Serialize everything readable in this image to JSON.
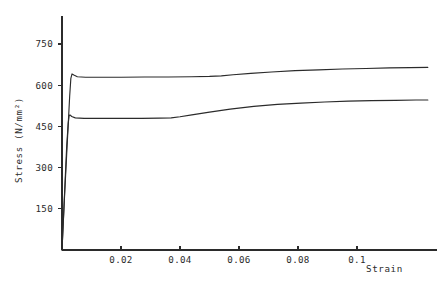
{
  "chart_data": {
    "type": "line",
    "title": "",
    "xlabel": "Strain",
    "ylabel": "Stress (N/mm²)",
    "xlim": [
      0,
      0.1271
    ],
    "ylim": [
      0,
      852
    ],
    "grid": false,
    "legend": "none",
    "xticks": [
      0.02,
      0.04,
      0.06,
      0.08,
      0.1
    ],
    "xtick_labels": [
      "0.02",
      "0.04",
      "0.06",
      "0.08",
      "0.1"
    ],
    "yticks": [
      150,
      300,
      450,
      600,
      750
    ],
    "ytick_labels": [
      "150",
      "300",
      "450",
      "600",
      "750"
    ],
    "series": [
      {
        "name": "upper-curve",
        "x": [
          0,
          0.0009,
          0.0019,
          0.0026,
          0.003,
          0.0034,
          0.004,
          0.0052,
          0.008,
          0.013,
          0.02,
          0.028,
          0.036,
          0.044,
          0.05,
          0.054,
          0.058,
          0.064,
          0.071,
          0.079,
          0.087,
          0.095,
          0.103,
          0.111,
          0.118,
          0.124
        ],
        "y": [
          0,
          205,
          415,
          560,
          625,
          641,
          637,
          631,
          629,
          629,
          629,
          630,
          630,
          631,
          632,
          634,
          638,
          643,
          648,
          653,
          656,
          659,
          661,
          663,
          664,
          665
        ]
      },
      {
        "name": "lower-curve",
        "x": [
          0,
          0.0008,
          0.0016,
          0.0021,
          0.0024,
          0.0027,
          0.0033,
          0.0045,
          0.0075,
          0.013,
          0.02,
          0.027,
          0.033,
          0.037,
          0.04,
          0.044,
          0.05,
          0.057,
          0.065,
          0.073,
          0.081,
          0.089,
          0.097,
          0.105,
          0.113,
          0.12,
          0.124
        ],
        "y": [
          0,
          190,
          380,
          460,
          488,
          492,
          486,
          481,
          479,
          479,
          479,
          479,
          480,
          481,
          485,
          492,
          502,
          513,
          523,
          530,
          535,
          539,
          542,
          544,
          545,
          546,
          546
        ]
      }
    ]
  },
  "axes": {
    "x_title": "Strain",
    "y_title": "Stress (N/mm²)"
  }
}
